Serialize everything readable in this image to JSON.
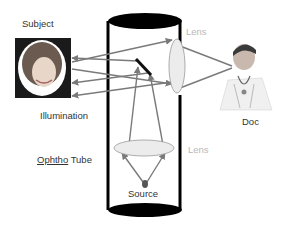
{
  "labels": {
    "subject": "Subject",
    "illumination": "Illumination",
    "ophtho_word": "Ophtho",
    "tube_word": "Tube",
    "lens_top": "Lens",
    "lens_bottom": "Lens",
    "doc": "Doc",
    "source": "Source"
  },
  "colors": {
    "tube": "#000000",
    "ray": "#7a7a7a",
    "lens_fill": "#ececec",
    "lens_label": "#b8b8b8",
    "text": "#333333"
  }
}
